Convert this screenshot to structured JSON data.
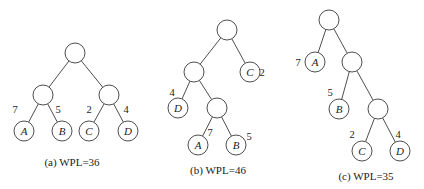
{
  "trees": [
    {
      "id": "a",
      "caption": "(a) WPL=36",
      "caption_pos": [
        72,
        166
      ],
      "nodes": [
        {
          "id": "r",
          "x": 75,
          "y": 53,
          "label": "",
          "weight": ""
        },
        {
          "id": "l",
          "x": 43,
          "y": 95,
          "label": "",
          "weight": ""
        },
        {
          "id": "rr",
          "x": 109,
          "y": 95,
          "label": "",
          "weight": ""
        },
        {
          "id": "A",
          "x": 24,
          "y": 131,
          "label": "A",
          "weight": "7",
          "wx": 15,
          "wy": 113
        },
        {
          "id": "B",
          "x": 62,
          "y": 131,
          "label": "B",
          "weight": "5",
          "wx": 58,
          "wy": 113
        },
        {
          "id": "C",
          "x": 89,
          "y": 131,
          "label": "C",
          "weight": "2",
          "wx": 89,
          "wy": 113
        },
        {
          "id": "D",
          "x": 128,
          "y": 131,
          "label": "D",
          "weight": "4",
          "wx": 126,
          "wy": 113
        }
      ],
      "edges": [
        [
          "r",
          "l"
        ],
        [
          "r",
          "rr"
        ],
        [
          "l",
          "A"
        ],
        [
          "l",
          "B"
        ],
        [
          "rr",
          "C"
        ],
        [
          "rr",
          "D"
        ]
      ]
    },
    {
      "id": "b",
      "caption": "(b) WPL=46",
      "caption_pos": [
        218,
        174
      ],
      "nodes": [
        {
          "id": "r",
          "x": 227,
          "y": 30,
          "label": "",
          "weight": ""
        },
        {
          "id": "l",
          "x": 194,
          "y": 72,
          "label": "",
          "weight": ""
        },
        {
          "id": "C",
          "x": 250,
          "y": 72,
          "label": "C",
          "weight": "2",
          "wx": 262,
          "wy": 76
        },
        {
          "id": "D",
          "x": 178,
          "y": 108,
          "label": "D",
          "weight": "4",
          "wx": 172,
          "wy": 96
        },
        {
          "id": "m",
          "x": 217,
          "y": 108,
          "label": "",
          "weight": ""
        },
        {
          "id": "A",
          "x": 198,
          "y": 145,
          "label": "A",
          "weight": "7",
          "wx": 210,
          "wy": 136
        },
        {
          "id": "B",
          "x": 236,
          "y": 145,
          "label": "B",
          "weight": "5",
          "wx": 249,
          "wy": 140
        }
      ],
      "edges": [
        [
          "r",
          "l"
        ],
        [
          "r",
          "C"
        ],
        [
          "l",
          "D"
        ],
        [
          "l",
          "m"
        ],
        [
          "m",
          "A"
        ],
        [
          "m",
          "B"
        ]
      ]
    },
    {
      "id": "c",
      "caption": "(c) WPL=35",
      "caption_pos": [
        366,
        180
      ],
      "nodes": [
        {
          "id": "r",
          "x": 329,
          "y": 20,
          "label": "",
          "weight": ""
        },
        {
          "id": "A",
          "x": 315,
          "y": 62,
          "label": "A",
          "weight": "7",
          "wx": 298,
          "wy": 66
        },
        {
          "id": "m1",
          "x": 352,
          "y": 62,
          "label": "",
          "weight": ""
        },
        {
          "id": "B",
          "x": 339,
          "y": 109,
          "label": "B",
          "weight": "5",
          "wx": 330,
          "wy": 96
        },
        {
          "id": "m2",
          "x": 378,
          "y": 109,
          "label": "",
          "weight": ""
        },
        {
          "id": "C",
          "x": 362,
          "y": 151,
          "label": "C",
          "weight": "2",
          "wx": 352,
          "wy": 138
        },
        {
          "id": "D",
          "x": 400,
          "y": 151,
          "label": "D",
          "weight": "4",
          "wx": 398,
          "wy": 138
        }
      ],
      "edges": [
        [
          "r",
          "A"
        ],
        [
          "r",
          "m1"
        ],
        [
          "m1",
          "B"
        ],
        [
          "m1",
          "m2"
        ],
        [
          "m2",
          "C"
        ],
        [
          "m2",
          "D"
        ]
      ]
    }
  ],
  "node_radius": 10
}
